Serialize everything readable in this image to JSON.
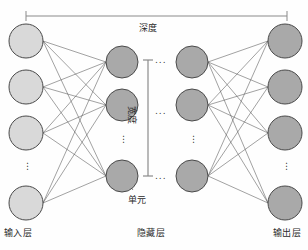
{
  "diagram": {
    "title": "",
    "type": "neural-network-architecture",
    "colors": {
      "input_node_fill": "#d9d9d9",
      "hidden_node_fill": "#a9a9a9",
      "output_node_fill": "#a9a9a9",
      "node_stroke": "#4a4a4a",
      "edge": "#555555",
      "bracket": "#8a8a8a",
      "text": "#2a2a2a",
      "background": "#fefefe"
    },
    "annotations": {
      "depth": "深度",
      "width": "宽度",
      "unit": "单元"
    },
    "layer_labels": {
      "input": "输入层",
      "hidden": "隐藏层",
      "output": "输出层"
    },
    "ellipsis": "⋮",
    "ellipsis_horizontal": "...",
    "layers": [
      {
        "id": "input",
        "label": "输入层",
        "node_count_visible": 4,
        "has_ellipsis": true,
        "ellipsis_after_index": 3,
        "cx": 26,
        "r": 17,
        "node_y": [
          41,
          87,
          133,
          203
        ],
        "ellipsis_y": 168
      },
      {
        "id": "hidden-1",
        "label": "隐藏层",
        "node_count_visible": 3,
        "has_ellipsis": true,
        "ellipsis_after_index": 2,
        "cx": 122,
        "r": 16,
        "node_y": [
          62,
          105,
          176
        ],
        "ellipsis_y": 141
      },
      {
        "id": "hidden-2",
        "label": "隐藏层",
        "node_count_visible": 3,
        "has_ellipsis": true,
        "ellipsis_after_index": 2,
        "cx": 192,
        "r": 16,
        "node_y": [
          62,
          105,
          176
        ],
        "ellipsis_y": 141
      },
      {
        "id": "output",
        "label": "输出层",
        "node_count_visible": 4,
        "has_ellipsis": true,
        "ellipsis_after_index": 3,
        "cx": 285,
        "r": 17,
        "node_y": [
          41,
          87,
          133,
          203
        ],
        "ellipsis_y": 168
      }
    ],
    "depth_bracket": {
      "label": "深度",
      "x_start": 26,
      "x_end": 287,
      "y": 16,
      "tick_height": 9
    },
    "width_bracket": {
      "label": "宽度",
      "x": 148,
      "y_start": 60,
      "y_end": 176,
      "tick_width": 9,
      "ellipsis_marks": [
        60,
        111,
        176
      ]
    },
    "unit_pointer": {
      "label": "单元",
      "from_x": 133,
      "from_y": 187,
      "to_x": 126,
      "to_y": 180
    }
  }
}
